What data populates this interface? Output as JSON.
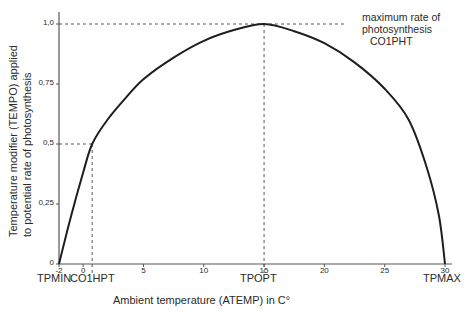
{
  "chart_data": {
    "type": "line",
    "title": "",
    "xlabel": "Ambient temperature (ATEMP) in C°",
    "ylabel_line1": "Temperature modifier (TEMPO) applied",
    "ylabel_line2": "to potential rate of photosynthesis",
    "xlim": [
      -2,
      30
    ],
    "ylim": [
      0,
      1.0
    ],
    "grid": false,
    "x_ticks": [
      {
        "value": -2,
        "label": "-2"
      },
      {
        "value": 0,
        "label": "0"
      },
      {
        "value": 5,
        "label": "5"
      },
      {
        "value": 10,
        "label": "10"
      },
      {
        "value": 15,
        "label": "15"
      },
      {
        "value": 20,
        "label": "20"
      },
      {
        "value": 25,
        "label": "25"
      },
      {
        "value": 30,
        "label": "30"
      }
    ],
    "y_ticks": [
      {
        "value": 0,
        "label": "0"
      },
      {
        "value": 0.25,
        "label": "0,25"
      },
      {
        "value": 0.5,
        "label": "0,5"
      },
      {
        "value": 0.75,
        "label": "0,75"
      },
      {
        "value": 1.0,
        "label": "1,0"
      }
    ],
    "series": [
      {
        "name": "TEMPO",
        "x": [
          -2,
          -1,
          0,
          0.75,
          2,
          3.5,
          5,
          7.5,
          10,
          12.5,
          15,
          17.5,
          20,
          22.5,
          25,
          27,
          28.5,
          29.5,
          30
        ],
        "values": [
          0,
          0.2,
          0.38,
          0.5,
          0.6,
          0.69,
          0.77,
          0.86,
          0.93,
          0.975,
          1.0,
          0.97,
          0.92,
          0.84,
          0.73,
          0.6,
          0.4,
          0.2,
          0
        ]
      }
    ],
    "annotations": {
      "tpmin": {
        "label": "TPMIN",
        "x": -2
      },
      "co1hpt": {
        "label": "CO1HPT",
        "x": 0.75,
        "y": 0.5
      },
      "topt": {
        "label": "TPOPT",
        "x": 15
      },
      "tpmax": {
        "label": "TPMAX",
        "x": 30
      },
      "max_rate": {
        "line1": "maximum rate of",
        "line2": "photosynthesis",
        "line3": "CO1PHT",
        "y": 1.0
      }
    }
  }
}
